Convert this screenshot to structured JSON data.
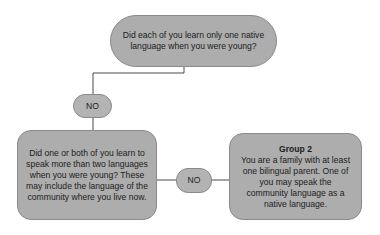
{
  "diagram": {
    "nodes": {
      "top_question": "Did each of you learn only one native language when you were young?",
      "answer_no_1": "NO",
      "left_question": "Did one or both of you learn to speak more than two languages when you were young? These may include the language of the community where you live now.",
      "answer_no_2": "NO",
      "result_title": "Group 2",
      "result_text": "You are a family with at least one bilingual parent. One of you may speak the community language as a native language."
    },
    "edges": [
      {
        "from": "top_question",
        "to": "answer_no_1"
      },
      {
        "from": "answer_no_1",
        "to": "left_question"
      },
      {
        "from": "left_question",
        "to": "answer_no_2"
      },
      {
        "from": "answer_no_2",
        "to": "result_title"
      }
    ],
    "colors": {
      "node_fill": "#adadad",
      "node_border": "#8a8a8a",
      "line": "#4a4a4a",
      "text": "#1c1c1c"
    }
  }
}
